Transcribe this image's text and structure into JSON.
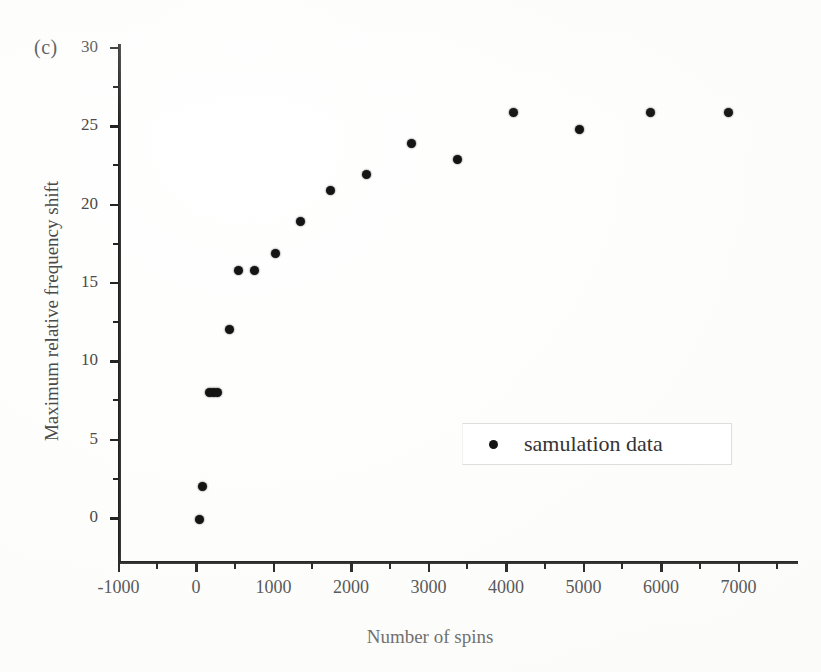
{
  "figure": {
    "panel_label": "(c)",
    "background_color": "#ffffff",
    "marker_color": "#141414",
    "axis_color": "#2b2b2b",
    "text_color": "#4a4a4a"
  },
  "legend": {
    "label": "samulation data",
    "marker": "filled-circle",
    "position": "center-right"
  },
  "chart_data": {
    "type": "scatter",
    "title": "",
    "subtitle": "",
    "xlabel": "Number of spins",
    "ylabel": "Maximum relative frequency shift",
    "xlim": [
      -1000,
      7500
    ],
    "ylim": [
      -2.8,
      30
    ],
    "grid": false,
    "legend_position": "center-right",
    "xticks": [
      -1000,
      0,
      1000,
      2000,
      3000,
      4000,
      5000,
      6000,
      7000
    ],
    "xtick_labels": [
      "-1000",
      "0",
      "1000",
      "2000",
      "3000",
      "4000",
      "5000",
      "6000",
      "7000"
    ],
    "xticks_minor": [
      -500,
      500,
      1500,
      2500,
      3500,
      4500,
      5500,
      6500,
      7500
    ],
    "yticks": [
      0,
      5,
      10,
      15,
      20,
      25,
      30
    ],
    "ytick_labels": [
      "0",
      "5",
      "10",
      "15",
      "20",
      "25",
      "30"
    ],
    "yticks_minor": [
      2.5,
      7.5,
      12.5,
      17.5,
      22.5,
      27.5
    ],
    "series": [
      {
        "name": "samulation data",
        "marker": "o",
        "color": "#141414",
        "points": [
          {
            "x": 50,
            "y": -0.1
          },
          {
            "x": 80,
            "y": 2.0
          },
          {
            "x": 180,
            "y": 8.0
          },
          {
            "x": 230,
            "y": 8.0
          },
          {
            "x": 280,
            "y": 8.0
          },
          {
            "x": 430,
            "y": 12.0
          },
          {
            "x": 550,
            "y": 15.8
          },
          {
            "x": 760,
            "y": 15.8
          },
          {
            "x": 1030,
            "y": 16.9
          },
          {
            "x": 1350,
            "y": 18.9
          },
          {
            "x": 1730,
            "y": 20.9
          },
          {
            "x": 2200,
            "y": 21.9
          },
          {
            "x": 2780,
            "y": 23.9
          },
          {
            "x": 3380,
            "y": 22.9
          },
          {
            "x": 4100,
            "y": 25.9
          },
          {
            "x": 4950,
            "y": 24.8
          },
          {
            "x": 5870,
            "y": 25.9
          },
          {
            "x": 6870,
            "y": 25.9
          }
        ]
      }
    ]
  }
}
